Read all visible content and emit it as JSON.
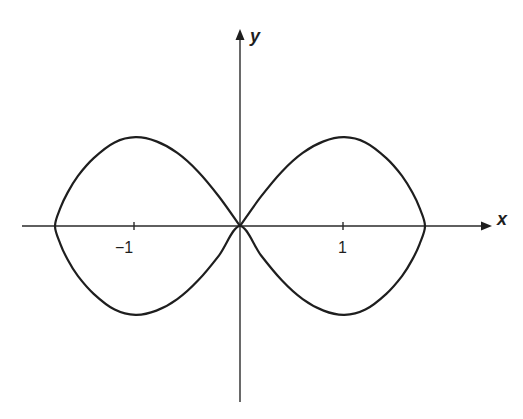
{
  "figure": {
    "axis_labels": {
      "x": "x",
      "y": "y"
    },
    "tick_labels": {
      "neg_one": "−1",
      "pos_one": "1"
    },
    "colors": {
      "curve": "#1e1e1e",
      "axis": "#2a2a2a",
      "background": "#ffffff"
    }
  },
  "chart_data": {
    "type": "line",
    "title": "",
    "xlabel": "x",
    "ylabel": "y",
    "x_ticks": [
      -1,
      1
    ],
    "x_tick_labels": [
      "−1",
      "1"
    ],
    "y_ticks": [],
    "grid": false,
    "legend": null,
    "xlim": [
      -2.1,
      2.4
    ],
    "ylim": [
      -1.7,
      1.9
    ],
    "key_points": {
      "crossing": [
        0,
        0
      ],
      "x_intercepts": [
        -1.77,
        0,
        1.77
      ],
      "maxima": [
        [
          -1,
          0.85
        ],
        [
          1,
          0.85
        ]
      ],
      "minima": [
        [
          -1,
          -0.85
        ],
        [
          1,
          -0.85
        ]
      ]
    },
    "series": [
      {
        "name": "curve",
        "x": [
          0,
          0.2,
          0.4,
          0.6,
          0.8,
          1.0,
          1.2,
          1.4,
          1.55,
          1.65,
          1.72,
          1.77
        ],
        "y_upper": [
          0,
          0.28,
          0.52,
          0.7,
          0.81,
          0.85,
          0.8,
          0.65,
          0.48,
          0.32,
          0.17,
          0
        ]
      }
    ]
  }
}
